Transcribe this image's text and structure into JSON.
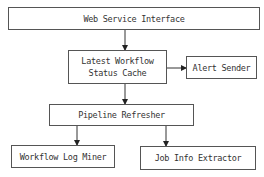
{
  "diagram": {
    "nodes": [
      {
        "id": "web",
        "label": "Web Service Interface"
      },
      {
        "id": "cache",
        "label_line1": "Latest Workflow",
        "label_line2": "Status Cache"
      },
      {
        "id": "alert",
        "label": "Alert Sender"
      },
      {
        "id": "pipeline",
        "label": "Pipeline Refresher"
      },
      {
        "id": "miner",
        "label": "Workflow Log Miner"
      },
      {
        "id": "extractor",
        "label": "Job Info Extractor"
      }
    ],
    "edges": [
      {
        "from": "web",
        "to": "cache"
      },
      {
        "from": "cache",
        "to": "alert"
      },
      {
        "from": "cache",
        "to": "pipeline"
      },
      {
        "from": "pipeline",
        "to": "miner"
      },
      {
        "from": "pipeline",
        "to": "extractor"
      }
    ]
  }
}
